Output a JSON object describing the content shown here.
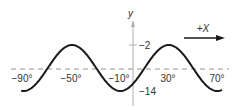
{
  "diagram": {
    "type": "sinusoid",
    "y_axis_label": "y",
    "direction_label": "+X",
    "y_ticks": [
      {
        "value": -2,
        "label": "−2"
      },
      {
        "value": -14,
        "label": "−14"
      }
    ],
    "x_ticks": [
      {
        "value": -90,
        "label": "−90°"
      },
      {
        "value": -50,
        "label": "−50°"
      },
      {
        "value": -10,
        "label": "−10°"
      },
      {
        "value": 30,
        "label": "30°"
      },
      {
        "value": 70,
        "label": "70°"
      }
    ],
    "midline_value": -8,
    "amplitude": 6,
    "period_deg": 80,
    "peak_x_deg": 30,
    "x_range_deg": [
      -90,
      70
    ],
    "colors": {
      "curve": "#1a1a1a",
      "axis": "#b0b0b0",
      "dashed": "#b8b8b8",
      "text": "#333333"
    }
  }
}
